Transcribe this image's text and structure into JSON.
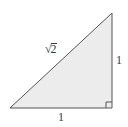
{
  "diagram": {
    "type": "right-triangle",
    "vertices": {
      "bottom_left": [
        10,
        108
      ],
      "bottom_right": [
        112,
        108
      ],
      "top_right": [
        112,
        13
      ]
    },
    "right_angle_marker": {
      "size": 6,
      "corner": "bottom_right"
    },
    "colors": {
      "fill": "#ececec",
      "stroke": "#555555",
      "text": "#3a3a3a"
    },
    "labels": {
      "hypotenuse": {
        "radical": "√",
        "radicand": "2"
      },
      "vertical_side": "1",
      "horizontal_side": "1"
    }
  }
}
